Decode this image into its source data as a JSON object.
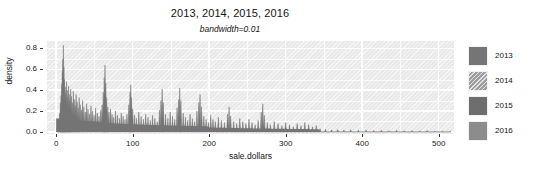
{
  "chart_data": {
    "type": "area",
    "title": "2013, 2014, 2015, 2016",
    "subtitle": "bandwidth=0.01",
    "xlabel": "sale.dollars",
    "ylabel": "density",
    "xlim": [
      -12,
      520
    ],
    "ylim": [
      -0.02,
      0.87
    ],
    "grid": true,
    "legend_position": "right",
    "x_ticks": [
      0,
      100,
      200,
      300,
      400,
      500
    ],
    "x_tick_labels": [
      "0",
      "100",
      "200",
      "300",
      "400",
      "500"
    ],
    "y_ticks": [
      0.0,
      0.2,
      0.4,
      0.6,
      0.8
    ],
    "y_tick_labels": [
      "0.0",
      "0.2",
      "0.4",
      "0.6",
      "0.8"
    ],
    "series": [
      {
        "name": "2013",
        "color": "#757575",
        "fill": "solid",
        "peaks": [
          [
            2.0,
            0.06
          ],
          [
            3.2,
            0.11
          ],
          [
            4.5,
            0.18
          ],
          [
            5.5,
            0.28
          ],
          [
            6.4,
            0.35
          ],
          [
            7.2,
            0.46
          ],
          [
            8.0,
            0.58
          ],
          [
            8.7,
            0.7
          ],
          [
            9.4,
            0.83
          ],
          [
            10.1,
            0.62
          ],
          [
            10.9,
            0.5
          ],
          [
            11.8,
            0.43
          ],
          [
            12.6,
            0.37
          ],
          [
            13.5,
            0.48
          ],
          [
            14.4,
            0.4
          ],
          [
            15.3,
            0.33
          ],
          [
            16.2,
            0.44
          ],
          [
            17.1,
            0.36
          ],
          [
            18.0,
            0.3
          ],
          [
            19.0,
            0.41
          ],
          [
            20.0,
            0.34
          ],
          [
            21.2,
            0.28
          ],
          [
            22.4,
            0.39
          ],
          [
            23.6,
            0.31
          ],
          [
            24.8,
            0.25
          ],
          [
            26.0,
            0.36
          ],
          [
            27.3,
            0.29
          ],
          [
            28.6,
            0.23
          ],
          [
            30.0,
            0.33
          ],
          [
            31.5,
            0.26
          ],
          [
            33.0,
            0.21
          ],
          [
            34.6,
            0.3
          ],
          [
            36.2,
            0.24
          ],
          [
            38.0,
            0.19
          ],
          [
            39.8,
            0.27
          ],
          [
            41.6,
            0.22
          ],
          [
            43.5,
            0.17
          ],
          [
            45.5,
            0.25
          ],
          [
            47.5,
            0.2
          ],
          [
            49.5,
            0.16
          ],
          [
            51.6,
            0.23
          ],
          [
            53.8,
            0.18
          ],
          [
            56.0,
            0.15
          ],
          [
            58.3,
            0.21
          ],
          [
            60.0,
            0.26
          ],
          [
            61.5,
            0.38
          ],
          [
            62.8,
            0.52
          ],
          [
            63.8,
            0.64
          ],
          [
            64.8,
            0.47
          ],
          [
            66.0,
            0.33
          ],
          [
            67.5,
            0.24
          ],
          [
            69.0,
            0.19
          ],
          [
            71.0,
            0.22
          ],
          [
            73.0,
            0.17
          ],
          [
            75.0,
            0.14
          ],
          [
            77.5,
            0.2
          ],
          [
            80.0,
            0.16
          ],
          [
            82.5,
            0.13
          ],
          [
            85.0,
            0.18
          ],
          [
            87.5,
            0.15
          ],
          [
            90.0,
            0.12
          ],
          [
            92.5,
            0.17
          ],
          [
            95.0,
            0.26
          ],
          [
            96.5,
            0.38
          ],
          [
            97.5,
            0.45
          ],
          [
            98.6,
            0.33
          ],
          [
            100.0,
            0.22
          ],
          [
            102.5,
            0.16
          ],
          [
            105.0,
            0.13
          ],
          [
            108.0,
            0.19
          ],
          [
            111.0,
            0.15
          ],
          [
            114.0,
            0.12
          ],
          [
            117.0,
            0.17
          ],
          [
            120.0,
            0.14
          ],
          [
            123.0,
            0.11
          ],
          [
            126.0,
            0.16
          ],
          [
            129.0,
            0.13
          ],
          [
            132.0,
            0.1
          ],
          [
            135.0,
            0.21
          ],
          [
            137.0,
            0.3
          ],
          [
            138.5,
            0.41
          ],
          [
            140.0,
            0.28
          ],
          [
            143.0,
            0.17
          ],
          [
            146.0,
            0.13
          ],
          [
            149.0,
            0.19
          ],
          [
            152.0,
            0.15
          ],
          [
            155.0,
            0.12
          ],
          [
            158.0,
            0.23
          ],
          [
            160.0,
            0.31
          ],
          [
            161.5,
            0.42
          ],
          [
            163.0,
            0.3
          ],
          [
            166.0,
            0.18
          ],
          [
            169.0,
            0.14
          ],
          [
            172.0,
            0.11
          ],
          [
            175.0,
            0.17
          ],
          [
            178.0,
            0.13
          ],
          [
            181.0,
            0.1
          ],
          [
            184.0,
            0.2
          ],
          [
            186.5,
            0.28
          ],
          [
            188.0,
            0.36
          ],
          [
            190.0,
            0.24
          ],
          [
            193.0,
            0.15
          ],
          [
            196.0,
            0.12
          ],
          [
            199.0,
            0.09
          ],
          [
            202.0,
            0.16
          ],
          [
            205.0,
            0.12
          ],
          [
            208.0,
            0.1
          ],
          [
            212.0,
            0.14
          ],
          [
            216.0,
            0.11
          ],
          [
            220.0,
            0.09
          ],
          [
            224.0,
            0.17
          ],
          [
            226.0,
            0.24
          ],
          [
            228.0,
            0.15
          ],
          [
            232.0,
            0.1
          ],
          [
            236.0,
            0.08
          ],
          [
            240.0,
            0.13
          ],
          [
            244.0,
            0.1
          ],
          [
            248.0,
            0.08
          ],
          [
            252.0,
            0.12
          ],
          [
            256.0,
            0.09
          ],
          [
            260.0,
            0.07
          ],
          [
            264.0,
            0.11
          ],
          [
            268.0,
            0.19
          ],
          [
            270.0,
            0.27
          ],
          [
            272.0,
            0.16
          ],
          [
            276.0,
            0.09
          ],
          [
            280.0,
            0.07
          ],
          [
            285.0,
            0.1
          ],
          [
            290.0,
            0.08
          ],
          [
            295.0,
            0.06
          ],
          [
            300.0,
            0.09
          ],
          [
            305.0,
            0.07
          ],
          [
            310.0,
            0.05
          ],
          [
            315.0,
            0.08
          ],
          [
            320.0,
            0.06
          ],
          [
            325.0,
            0.09
          ],
          [
            330.0,
            0.07
          ],
          [
            335.0,
            0.05
          ],
          [
            340.0,
            0.06
          ],
          [
            345.0,
            0.03
          ],
          [
            352.0,
            0.025
          ],
          [
            360.0,
            0.02
          ],
          [
            368.0,
            0.022
          ],
          [
            376.0,
            0.018
          ],
          [
            385.0,
            0.02
          ],
          [
            395.0,
            0.016
          ],
          [
            405.0,
            0.018
          ],
          [
            415.0,
            0.014
          ],
          [
            425.0,
            0.016
          ],
          [
            435.0,
            0.012
          ],
          [
            445.0,
            0.015
          ],
          [
            455.0,
            0.011
          ],
          [
            465.0,
            0.013
          ],
          [
            475.0,
            0.01
          ],
          [
            485.0,
            0.014
          ],
          [
            495.0,
            0.009
          ],
          [
            505.0,
            0.008
          ],
          [
            515.0,
            0.006
          ]
        ]
      },
      {
        "name": "2014",
        "color": "#9a9a9a",
        "fill": "hatched"
      },
      {
        "name": "2015",
        "color": "#6e6e6e",
        "fill": "solid"
      },
      {
        "name": "2016",
        "color": "#8c8c8c",
        "fill": "solid"
      }
    ]
  },
  "legend": {
    "items": [
      {
        "label": "2013",
        "color": "#757575",
        "fill": "solid"
      },
      {
        "label": "2014",
        "color": "#9e9e9e",
        "fill": "hatched"
      },
      {
        "label": "2015",
        "color": "#6e6e6e",
        "fill": "solid"
      },
      {
        "label": "2016",
        "color": "#8c8c8c",
        "fill": "solid"
      }
    ]
  },
  "style": {
    "panel_background": "#e9e9e9",
    "grid_color": "#ffffff",
    "text_color": "#141414"
  }
}
